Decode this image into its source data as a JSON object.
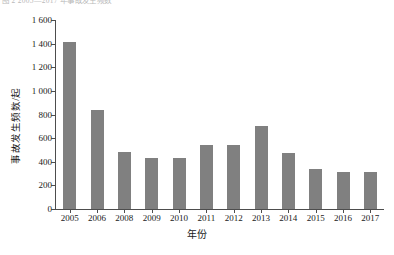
{
  "caption": {
    "top_partial_text": "图 2  2005—2017 年事故发生频数"
  },
  "chart_data": {
    "type": "bar",
    "title": "",
    "xlabel": "年份",
    "ylabel": "事故发生频数/起",
    "categories": [
      "2005",
      "2006",
      "2008",
      "2009",
      "2010",
      "2011",
      "2012",
      "2013",
      "2014",
      "2015",
      "2016",
      "2017"
    ],
    "values": [
      1410,
      840,
      480,
      430,
      430,
      545,
      545,
      705,
      475,
      340,
      310,
      310
    ],
    "series": [
      {
        "name": "事故发生频数",
        "values": [
          1410,
          840,
          480,
          430,
          430,
          545,
          545,
          705,
          475,
          340,
          310,
          310
        ]
      }
    ],
    "ylim": [
      0,
      1600
    ],
    "y_ticks": [
      0,
      200,
      400,
      600,
      800,
      1000,
      1200,
      1400,
      1600
    ],
    "y_tick_labels": [
      "0",
      "200",
      "400",
      "600",
      "800",
      "1 000",
      "1 200",
      "1 400",
      "1 600"
    ],
    "grid": false,
    "legend": "none",
    "bar_color": "#808080",
    "axis_color": "#4d4d4d"
  }
}
